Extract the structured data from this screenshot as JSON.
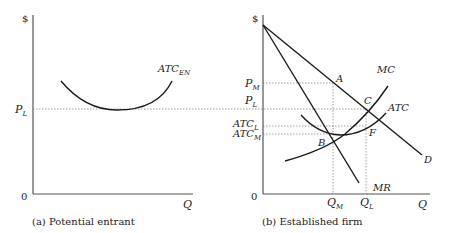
{
  "panels": [
    {
      "caption": "(a) Potential entrant",
      "y_axis_label": "$",
      "x_axis_label": "Q",
      "origin": "0",
      "price_label_main": "P",
      "price_label_sub": "L",
      "curve_label_main": "ATC",
      "curve_label_sub": "EN"
    },
    {
      "caption": "(b) Established firm",
      "y_axis_label": "$",
      "x_axis_label": "Q",
      "origin": "0",
      "pm_main": "P",
      "pm_sub": "M",
      "pl_main": "P",
      "pl_sub": "L",
      "atcl_main": "ATC",
      "atcl_sub": "L",
      "atcm_main": "ATC",
      "atcm_sub": "M",
      "qm_main": "Q",
      "qm_sub": "M",
      "ql_main": "Q",
      "ql_sub": "L",
      "points": {
        "a": "A",
        "b": "B",
        "c": "C",
        "f": "F"
      },
      "curves": {
        "mc": "MC",
        "atc": "ATC",
        "d": "D",
        "mr": "MR"
      }
    }
  ],
  "colors": {
    "line": "#1a1a1a",
    "axis": "#555555",
    "dotted": "#888888"
  }
}
